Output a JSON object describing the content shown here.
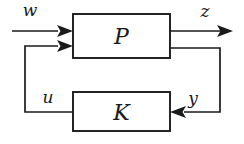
{
  "diagram": {
    "kind": "control-feedback-block-diagram",
    "background_color": "#ffffff",
    "line_color": "#1a1a1a",
    "blocks": [
      {
        "id": "plant",
        "label": "P",
        "x": 73,
        "y": 14,
        "width": 97,
        "height": 44
      },
      {
        "id": "controller",
        "label": "K",
        "x": 73,
        "y": 92,
        "width": 97,
        "height": 39
      }
    ],
    "signals": [
      {
        "id": "w",
        "label": "w",
        "label_x": 30,
        "label_y": 16,
        "role": "exogenous-input"
      },
      {
        "id": "z",
        "label": "z",
        "label_x": 205,
        "label_y": 17,
        "role": "performance-output"
      },
      {
        "id": "u",
        "label": "u",
        "label_x": 48,
        "label_y": 103,
        "role": "control-input"
      },
      {
        "id": "y",
        "label": "y",
        "label_x": 193,
        "label_y": 103,
        "role": "measured-output"
      }
    ],
    "wires": {
      "w_in": "M 12,31 L 194,31",
      "z_out": "M 170,31 L 230,31",
      "u_feedback": "M 73,112 L 25,112 L 25,46 L 64,46",
      "y_feedback": "M 170,48 L 220,48 L 220,112 L 178,112"
    }
  }
}
